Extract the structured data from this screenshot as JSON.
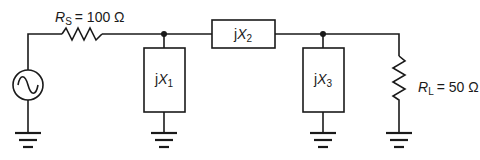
{
  "diagram": {
    "type": "circuit-schematic",
    "title": "",
    "stroke_color": "#1a1a1a",
    "background": "#ffffff",
    "components": {
      "source": {
        "kind": "ac-voltage-source",
        "icon": "sine-wave-icon"
      },
      "rs": {
        "kind": "resistor",
        "symbol": "R",
        "subscript": "S",
        "value": "= 100 Ω"
      },
      "x1": {
        "kind": "shunt-reactance",
        "prefix": "j",
        "symbol": "X",
        "subscript": "1"
      },
      "x2": {
        "kind": "series-reactance",
        "prefix": "j",
        "symbol": "X",
        "subscript": "2"
      },
      "x3": {
        "kind": "shunt-reactance",
        "prefix": "j",
        "symbol": "X",
        "subscript": "3"
      },
      "rl": {
        "kind": "resistor",
        "symbol": "R",
        "subscript": "L",
        "value": "= 50 Ω"
      }
    },
    "grounds": [
      "source",
      "x1",
      "x3",
      "rl"
    ],
    "junctions": [
      "node-x1",
      "node-x3"
    ]
  }
}
